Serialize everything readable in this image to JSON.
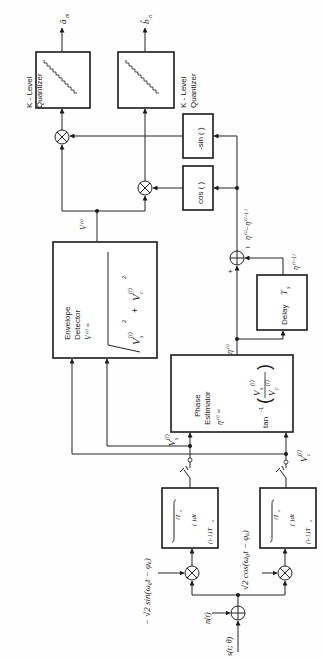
{
  "diagram": {
    "type": "block-diagram",
    "orientation": "rotated-90-ccw",
    "blocks": {
      "quantizer_a": {
        "label_line1": "K - Level",
        "label_line2": "Quantizer",
        "output": "â",
        "output_sub": "m"
      },
      "quantizer_b": {
        "label_line1": "K - Level",
        "label_line2": "Quantizer",
        "output": "b̂",
        "output_sub": "n"
      },
      "neg_sin": {
        "label": "-sin (  )"
      },
      "cos": {
        "label": "cos (  )"
      },
      "envelope_detector": {
        "label_line1": "Envelope",
        "label_line2": "Detector",
        "formula_lhs": "V⁽ⁱ⁾  =",
        "formula_rhs": "√( (V_s⁽ⁱ⁾)² + (V_c⁽ⁱ⁾)² )",
        "term1": "V",
        "term1_sub": "s",
        "term2": "V",
        "term2_sub": "c",
        "sup": "(i)",
        "power": "2",
        "plus": "+"
      },
      "delay": {
        "label": "Delay",
        "param": "T",
        "param_sub": "s"
      },
      "phase_estimator": {
        "label_line1": "Phase",
        "label_line2": "Estimator",
        "formula_lhs": "η⁽ⁱ⁾ =",
        "formula_fn": "tan",
        "formula_exp": "-1",
        "numerator": "V",
        "numerator_sub": "s",
        "denominator": "V",
        "denominator_sub": "c",
        "sup": "(i)"
      },
      "integrator_s": {
        "upper": "iT",
        "upper_sub": "s",
        "body": "(  )dt",
        "lower": "(i-1)T",
        "lower_sub": "s"
      },
      "integrator_c": {
        "upper": "iT",
        "upper_sub": "s",
        "body": "(  )dt",
        "lower": "(i-1)T",
        "lower_sub": "s"
      }
    },
    "signals": {
      "V_i": "V⁽ⁱ⁾",
      "eta_i": "η⁽ⁱ⁾",
      "eta_i_minus_1": "η⁽ⁱ⁻¹⁾",
      "eta_diff": "η⁽ⁱ⁾−η⁽ⁱ⁻¹⁾",
      "Vs_i": "V",
      "Vs_sub": "s",
      "Vc_i": "V",
      "Vc_sub": "c",
      "sup_i": "(i)",
      "plus_sign": "+",
      "minus_sign": "−",
      "noise": "n(t)",
      "signal_in": "s(t; θ)",
      "ref_sin": "− √2 sin(ω₀t − φₐ)",
      "ref_cos": "√2 cos(ω₀t − φₐ)"
    }
  }
}
